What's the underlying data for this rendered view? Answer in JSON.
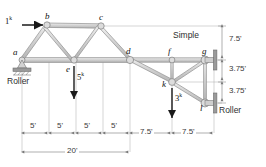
{
  "figure": {
    "type": "truss-structure-diagram",
    "nodes": [
      {
        "id": "a",
        "label": "a",
        "x": 22,
        "y": 60
      },
      {
        "id": "b",
        "label": "b",
        "x": 47,
        "y": 25
      },
      {
        "id": "c",
        "label": "c",
        "x": 101,
        "y": 26
      },
      {
        "id": "d",
        "label": "d",
        "x": 130,
        "y": 60
      },
      {
        "id": "e",
        "label": "e",
        "x": 74,
        "y": 60
      },
      {
        "id": "f",
        "label": "f",
        "x": 172,
        "y": 60
      },
      {
        "id": "g",
        "label": "g",
        "x": 205,
        "y": 60
      },
      {
        "id": "k",
        "label": "k",
        "x": 172,
        "y": 82
      },
      {
        "id": "l",
        "label": "l",
        "x": 205,
        "y": 103
      }
    ],
    "members": [
      [
        "a",
        "b"
      ],
      [
        "b",
        "c"
      ],
      [
        "a",
        "e"
      ],
      [
        "e",
        "d"
      ],
      [
        "b",
        "e"
      ],
      [
        "c",
        "e"
      ],
      [
        "c",
        "d"
      ],
      [
        "d",
        "k"
      ],
      [
        "d",
        "f"
      ],
      [
        "f",
        "g"
      ],
      [
        "f",
        "k"
      ],
      [
        "k",
        "g"
      ],
      [
        "k",
        "l"
      ],
      [
        "g",
        "l"
      ]
    ],
    "loads": [
      {
        "id": "load-1k",
        "value": "1",
        "unit": "k",
        "label": "1",
        "sup": "k",
        "direction": "right",
        "at": "b"
      },
      {
        "id": "load-5k",
        "value": "5",
        "unit": "k",
        "label": "5",
        "sup": "k",
        "direction": "down",
        "at": "e"
      },
      {
        "id": "load-3k",
        "value": "3",
        "unit": "k",
        "label": "3",
        "sup": "k",
        "direction": "down",
        "at": "k"
      }
    ],
    "supports": [
      {
        "id": "support-a",
        "label": "Roller",
        "type": "roller",
        "at": "a"
      },
      {
        "id": "support-g",
        "label": "Simple",
        "type": "simple",
        "at": "g"
      },
      {
        "id": "support-l",
        "label": "Roller",
        "type": "roller",
        "at": "l"
      }
    ],
    "horizontal_dimensions": [
      {
        "label": "5'",
        "from": 22,
        "to": 49
      },
      {
        "label": "5'",
        "from": 49,
        "to": 76
      },
      {
        "label": "5'",
        "from": 76,
        "to": 103
      },
      {
        "label": "5'",
        "from": 103,
        "to": 130
      },
      {
        "label": "7.5'",
        "from": 130,
        "to": 172
      },
      {
        "label": "7.5'",
        "from": 172,
        "to": 214
      }
    ],
    "overall_dimension": {
      "label": "20'",
      "from": 22,
      "to": 130
    },
    "vertical_dimensions": [
      {
        "label": "7.5'",
        "from_y": 25,
        "to_y": 60
      },
      {
        "label": "3.75'",
        "from_y": 60,
        "to_y": 82
      },
      {
        "label": "3.75'",
        "from_y": 82,
        "to_y": 103
      }
    ],
    "colors": {
      "member_fill": "#d6d6d6",
      "member_stroke": "#8c8c8c",
      "dimension_line": "#8a8a8a",
      "text": "#111111",
      "load_arrow": "#1a1a1a"
    }
  }
}
